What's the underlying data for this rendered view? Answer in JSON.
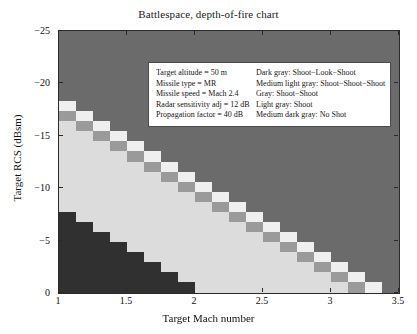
{
  "chart_data": {
    "type": "heatmap",
    "title": "Battlespace, depth-of-fire chart",
    "xlabel": "Target Mach number",
    "ylabel": "Target RCS (dBsm)",
    "xlim": [
      1.0,
      3.5
    ],
    "ylim": [
      -25.0,
      0.0
    ],
    "y_axis_inverted": true,
    "grid": false,
    "xticks": [
      1,
      1.5,
      2,
      2.5,
      3,
      3.5
    ],
    "xtick_labels": [
      "1",
      "1.5",
      "2",
      "2.5",
      "3",
      "3.5"
    ],
    "yticks": [
      -25,
      -20,
      -15,
      -10,
      -5,
      0
    ],
    "ytick_labels": [
      "-25",
      "-20",
      "-15",
      "-10",
      "-5",
      "0"
    ],
    "n_cols": 20,
    "n_rows": 26,
    "category_order": [
      "shoot_look_shoot",
      "shoot_shoot_shoot",
      "shoot_shoot",
      "shoot",
      "no_shot"
    ],
    "category_colors": {
      "shoot_look_shoot": "#6b6b6b",
      "shoot_shoot_shoot": "#efefef",
      "shoot_shoot": "#9a9a9a",
      "shoot": "#dcdcdc",
      "no_shot": "#303030"
    },
    "category_labels": {
      "shoot_look_shoot": "Shoot-Look-Shoot",
      "shoot_shoot_shoot": "Shoot-Shoot-Shoot",
      "shoot_shoot": "Shoot-Shoot",
      "shoot": "Shoot",
      "no_shot": "No Shot"
    },
    "band_description": "Diagonal staircase band descending left-to-right separating upper dark-gray Shoot-Look-Shoot region from lower light-gray Shoot region; band composed of alternating Shoot-Shoot (gray) and Shoot-Shoot-Shoot (near-white) cells. Lower-left triangular No Shot region in medium dark gray.",
    "grid_rows": [
      "00000000000000000000",
      "00000000000000000000",
      "00000000000000000000",
      "00000000000000000000",
      "00000000000000000000",
      "00000000000000000000",
      "00000000000000000000",
      "10000000000000000000",
      "21000000000000000000",
      "32100000000000000000",
      "33210000000000000000",
      "33321000000000000000",
      "33332100000000000000",
      "33333210000000000000",
      "33333321000000000000",
      "33333332100000000000",
      "33333333210000000000",
      "33333333321000000000",
      "43333333332100000000",
      "44333333333210000000",
      "44433333333321000000",
      "44443333333332100000",
      "44444333333333210000",
      "44444433333333321000",
      "44444443333333332100",
      "44444444333333333210"
    ]
  },
  "legend": {
    "parameters": [
      "Target altitude = 50 m",
      "Missile type = MR",
      "Missile speed = Mach 2.4",
      "Radar sensitivity adj = 12 dB",
      "Propagation factor = 40 dB"
    ],
    "keys": [
      "Dark gray: Shoot-Look-Shoot",
      "Medium light gray: Shoot-Shoot-Shoot",
      "Gray: Shoot-Shoot",
      "Light gray: Shoot",
      "Medium dark gray: No Shot"
    ]
  }
}
